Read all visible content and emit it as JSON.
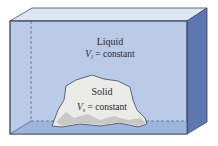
{
  "diagram": {
    "container": "tank",
    "liquid": {
      "label": "Liquid",
      "symbol": "V",
      "subscript": "l",
      "equation": " = constant"
    },
    "solid": {
      "label": "Solid",
      "symbol": "V",
      "subscript": "s",
      "equation": " = constant"
    },
    "colors": {
      "front_face": "#b9cbe6",
      "top_face": "#dde7f3",
      "side_face": "#5f77b0",
      "floor": "#9db5dc",
      "solid_fill": "#ebebe8",
      "outline": "#3b4660"
    }
  }
}
